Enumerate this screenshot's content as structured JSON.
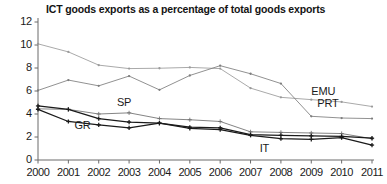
{
  "chart_data": {
    "type": "line",
    "title": "ICT goods exports as a percentage of total goods exports",
    "xlabel": "",
    "ylabel": "",
    "x": [
      2000,
      2001,
      2002,
      2003,
      2004,
      2005,
      2006,
      2007,
      2008,
      2009,
      2010,
      2011
    ],
    "categories": [
      "2000",
      "2001",
      "2002",
      "2003",
      "2004",
      "2005",
      "2006",
      "2007",
      "2008",
      "2009",
      "2010",
      "2011"
    ],
    "xlim": [
      2000,
      2011
    ],
    "ylim": [
      0,
      12
    ],
    "yticks": [
      0,
      2,
      4,
      6,
      8,
      10,
      12
    ],
    "ytick_labels": [
      "0",
      "2",
      "4",
      "6",
      "8",
      "10",
      "12"
    ],
    "grid": false,
    "legend": "inline-annotations",
    "series": [
      {
        "name": "EMU",
        "color": "#9a9a9a",
        "marker": "dot",
        "values": [
          10.1,
          9.4,
          8.25,
          7.95,
          7.98,
          8.05,
          7.95,
          6.25,
          5.45,
          5.25,
          5.05,
          4.65
        ]
      },
      {
        "name": "PRT",
        "color": "#7d7d7d",
        "marker": "dot",
        "values": [
          6.05,
          6.95,
          6.45,
          7.3,
          6.1,
          7.35,
          8.2,
          7.5,
          6.65,
          3.8,
          3.65,
          3.6
        ]
      },
      {
        "name": "SP",
        "color": "#6e6e6e",
        "marker": "plus",
        "values": [
          4.45,
          4.4,
          4.0,
          4.1,
          3.6,
          3.5,
          3.35,
          2.45,
          2.4,
          2.35,
          2.3,
          1.85
        ]
      },
      {
        "name": "GR",
        "color": "#1a1a1a",
        "marker": "plus",
        "values": [
          4.4,
          3.35,
          3.05,
          2.8,
          3.2,
          2.75,
          2.65,
          2.15,
          1.85,
          1.8,
          1.95,
          1.3
        ]
      },
      {
        "name": "IT",
        "color": "#1a1a1a",
        "marker": "plus",
        "values": [
          4.7,
          4.4,
          3.6,
          3.3,
          3.2,
          2.85,
          2.8,
          2.2,
          2.15,
          2.1,
          2.05,
          1.9
        ]
      }
    ],
    "annotations": [
      {
        "text": "EMU",
        "x": 2009.0,
        "y": 5.95
      },
      {
        "text": "PRT",
        "x": 2009.2,
        "y": 4.85
      },
      {
        "text": "SP",
        "x": 2002.6,
        "y": 4.95
      },
      {
        "text": "GR",
        "x": 2001.2,
        "y": 2.95
      },
      {
        "text": "IT",
        "x": 2007.3,
        "y": 1.0
      }
    ]
  }
}
